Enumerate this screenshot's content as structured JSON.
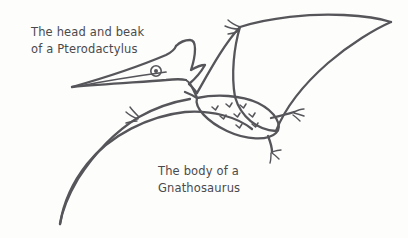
{
  "canvas": {
    "width": 408,
    "height": 238,
    "background_color": "#fdfdfc",
    "ink_color": "#55555a",
    "text_color": "#4a4a4c"
  },
  "annotations": [
    {
      "id": "head-label",
      "line1": "The head and beak",
      "line2": "of a Pterodactylus"
    },
    {
      "id": "body-label",
      "line1": "The body of a",
      "line2": "Gnathosaurus"
    }
  ],
  "illustration": {
    "subject": "pterosaur-sketch",
    "parts": [
      "beak",
      "head-crest",
      "eye",
      "neck",
      "body",
      "right-wing",
      "left-wing",
      "wing-claw-right",
      "wing-claw-left",
      "upper-leg",
      "lower-leg",
      "body-scales"
    ]
  }
}
